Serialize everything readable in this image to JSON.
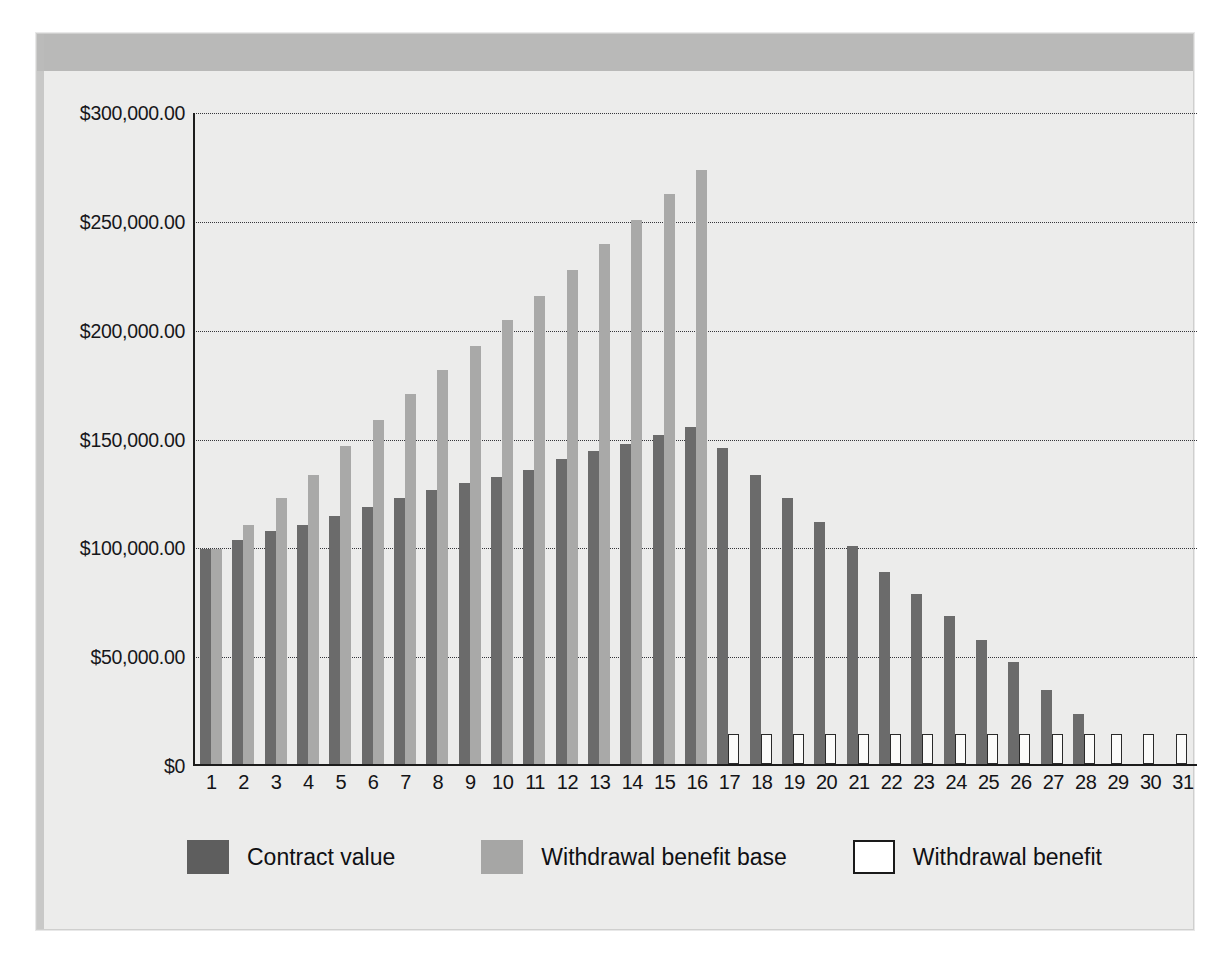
{
  "chart_data": {
    "type": "bar",
    "title": "",
    "subtitle": "",
    "xlabel": "",
    "ylabel": "",
    "grid": true,
    "legend_position": "bottom",
    "ylim": [
      0,
      300000
    ],
    "ytick_values": [
      300000,
      250000,
      200000,
      150000,
      100000,
      50000,
      0
    ],
    "ytick_labels": [
      "$300,000.00",
      "$250,000.00",
      "$200,000.00",
      "$150,000.00",
      "$100,000.00",
      "$50,000.00",
      "$0"
    ],
    "categories": [
      "1",
      "2",
      "3",
      "4",
      "5",
      "6",
      "7",
      "8",
      "9",
      "10",
      "11",
      "12",
      "13",
      "14",
      "15",
      "16",
      "17",
      "18",
      "19",
      "20",
      "21",
      "22",
      "23",
      "24",
      "25",
      "26",
      "27",
      "28",
      "29",
      "30",
      "31"
    ],
    "series": [
      {
        "name": "Contract value",
        "color": "#6b6b6b",
        "values": [
          99000,
          103000,
          107000,
          110000,
          114000,
          118000,
          122000,
          126000,
          129000,
          132000,
          135000,
          140000,
          144000,
          147000,
          151000,
          155000,
          145000,
          133000,
          122000,
          111000,
          100000,
          88000,
          78000,
          68000,
          57000,
          47000,
          34000,
          23000,
          0,
          0,
          0
        ]
      },
      {
        "name": "Withdrawal benefit base",
        "color": "#a9a9a8",
        "values": [
          99000,
          110000,
          122000,
          133000,
          146000,
          158000,
          170000,
          181000,
          192000,
          204000,
          215000,
          227000,
          239000,
          250000,
          262000,
          273000,
          0,
          0,
          0,
          0,
          0,
          0,
          0,
          0,
          0,
          0,
          0,
          0,
          0,
          0,
          0
        ]
      },
      {
        "name": "Withdrawal benefit",
        "color": "#ffffff",
        "values": [
          0,
          0,
          0,
          0,
          0,
          0,
          0,
          0,
          0,
          0,
          0,
          0,
          0,
          0,
          0,
          0,
          13600,
          13600,
          13600,
          13600,
          13600,
          13600,
          13600,
          13600,
          13600,
          13600,
          13600,
          13600,
          13600,
          13600,
          13600
        ]
      }
    ]
  },
  "legend": {
    "items": [
      {
        "label": "Contract value",
        "swatch": "dark-gray-filled"
      },
      {
        "label": "Withdrawal benefit base",
        "swatch": "light-gray-filled"
      },
      {
        "label": "Withdrawal benefit",
        "swatch": "white-outlined"
      }
    ]
  },
  "colors": {
    "contract_value": "#6b6b6b",
    "withdrawal_benefit_base": "#a9a9a8",
    "withdrawal_benefit": "#ffffff",
    "withdrawal_benefit_border": "#2a2a2a",
    "plot_background": "#ececeb",
    "header_band": "#b9b9b8",
    "axis": "#1c1c1c",
    "gridline": "#35353a"
  },
  "page_bleed": {
    "note": "faint reversed show-through text from the opposite page of the scanned document",
    "lines": [
      "Contract Value",
      "Benefit",
      "Withdrawal",
      "Benefit",
      "Base",
      "Death Benefit",
      "Legacy Benefit"
    ]
  }
}
